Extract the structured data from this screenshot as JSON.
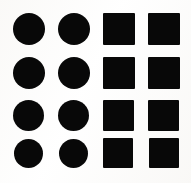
{
  "figure": {
    "background_color": "#fbfbfa",
    "shape_color": "#080808",
    "width": 191,
    "height": 183,
    "rows": 4,
    "columns": 4,
    "column_shapes": [
      "circle",
      "circle",
      "square",
      "square"
    ],
    "counts": {
      "circles": 8,
      "squares": 8,
      "total": 16
    },
    "shapes": [
      {
        "name": "circle-r1c1",
        "type": "circle",
        "row": 1,
        "col": 1,
        "x": 13,
        "y": 13,
        "w": 32,
        "h": 32
      },
      {
        "name": "circle-r1c2",
        "type": "circle",
        "row": 1,
        "col": 2,
        "x": 58,
        "y": 13,
        "w": 32,
        "h": 32
      },
      {
        "name": "square-r1c3",
        "type": "square",
        "row": 1,
        "col": 3,
        "x": 103,
        "y": 13,
        "w": 32,
        "h": 32
      },
      {
        "name": "square-r1c4",
        "type": "square",
        "row": 1,
        "col": 4,
        "x": 148,
        "y": 13,
        "w": 32,
        "h": 32
      },
      {
        "name": "circle-r2c1",
        "type": "circle",
        "row": 2,
        "col": 1,
        "x": 13,
        "y": 57,
        "w": 32,
        "h": 32
      },
      {
        "name": "circle-r2c2",
        "type": "circle",
        "row": 2,
        "col": 2,
        "x": 58,
        "y": 57,
        "w": 32,
        "h": 32
      },
      {
        "name": "square-r2c3",
        "type": "square",
        "row": 2,
        "col": 3,
        "x": 103,
        "y": 57,
        "w": 32,
        "h": 32
      },
      {
        "name": "square-r2c4",
        "type": "square",
        "row": 2,
        "col": 4,
        "x": 148,
        "y": 57,
        "w": 32,
        "h": 32
      },
      {
        "name": "circle-r3c1",
        "type": "circle",
        "row": 3,
        "col": 1,
        "x": 13,
        "y": 100,
        "w": 31,
        "h": 31
      },
      {
        "name": "circle-r3c2",
        "type": "circle",
        "row": 3,
        "col": 2,
        "x": 58,
        "y": 100,
        "w": 31,
        "h": 31
      },
      {
        "name": "square-r3c3",
        "type": "square",
        "row": 3,
        "col": 3,
        "x": 103,
        "y": 100,
        "w": 31,
        "h": 31
      },
      {
        "name": "square-r3c4",
        "type": "square",
        "row": 3,
        "col": 4,
        "x": 148,
        "y": 100,
        "w": 31,
        "h": 31
      },
      {
        "name": "circle-r4c1",
        "type": "circle",
        "row": 4,
        "col": 1,
        "x": 14,
        "y": 139,
        "w": 29,
        "h": 29
      },
      {
        "name": "circle-r4c2",
        "type": "circle",
        "row": 4,
        "col": 2,
        "x": 59,
        "y": 139,
        "w": 29,
        "h": 29
      },
      {
        "name": "square-r4c3",
        "type": "square",
        "row": 4,
        "col": 3,
        "x": 103,
        "y": 138,
        "w": 30,
        "h": 30
      },
      {
        "name": "square-r4c4",
        "type": "square",
        "row": 4,
        "col": 4,
        "x": 149,
        "y": 138,
        "w": 30,
        "h": 30
      }
    ]
  }
}
